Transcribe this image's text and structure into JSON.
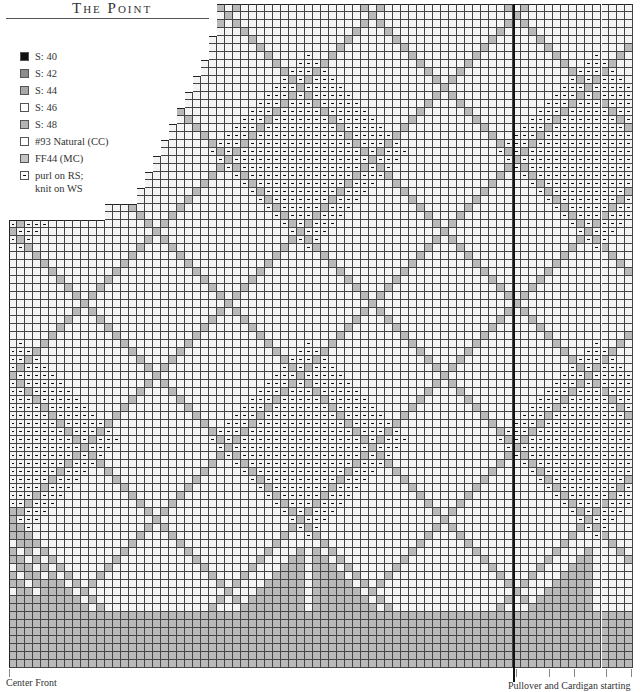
{
  "title": "The Point",
  "legend": [
    {
      "label": "S: 40",
      "color": "#111111",
      "purl": false
    },
    {
      "label": "S: 42",
      "color": "#8c8c8c",
      "purl": false
    },
    {
      "label": "S: 44",
      "color": "#a8a8a8",
      "purl": false
    },
    {
      "label": "S: 46",
      "color": "#ffffff",
      "purl": false
    },
    {
      "label": "S: 48",
      "color": "#b4b4b4",
      "purl": false
    },
    {
      "label": "#93 Natural (CC)",
      "color": "#ffffff",
      "purl": false
    },
    {
      "label": "FF44 (MC)",
      "color": "#c4c4c4",
      "purl": false
    },
    {
      "label": "purl on RS;\nknit on WS",
      "color": "#ffffff",
      "purl": true
    }
  ],
  "captions": {
    "center_front": "Center Front",
    "starting_points": "Pullover and Cardigan starting points."
  },
  "chart": {
    "origin_x": 9,
    "origin_y": 668,
    "cell": 8,
    "cols": 78,
    "rows": 83,
    "colors": {
      "cc": "#f4f4f4",
      "mc": "#b9b9b9",
      "line": "#444444"
    },
    "top_steps": [
      {
        "from_col": 0,
        "to_col": 12,
        "top_row": 56
      },
      {
        "from_col": 12,
        "to_col": 16,
        "top_row": 58
      },
      {
        "from_col": 16,
        "to_col": 17,
        "top_row": 60
      },
      {
        "from_col": 17,
        "to_col": 18,
        "top_row": 62
      },
      {
        "from_col": 18,
        "to_col": 19,
        "top_row": 64
      },
      {
        "from_col": 19,
        "to_col": 20,
        "top_row": 66
      },
      {
        "from_col": 20,
        "to_col": 21,
        "top_row": 68
      },
      {
        "from_col": 21,
        "to_col": 22,
        "top_row": 70
      },
      {
        "from_col": 22,
        "to_col": 23,
        "top_row": 72
      },
      {
        "from_col": 23,
        "to_col": 24,
        "top_row": 74
      },
      {
        "from_col": 24,
        "to_col": 25,
        "top_row": 76
      },
      {
        "from_col": 25,
        "to_col": 26,
        "top_row": 79
      },
      {
        "from_col": 26,
        "to_col": 78,
        "top_row": 83
      }
    ],
    "pattern": {
      "diamond_period": 18,
      "purl_period": 36,
      "purl_offset": 19,
      "base_rows": 7,
      "point_apexes": [
        {
          "col": 19,
          "row": 10,
          "type": "purl"
        },
        {
          "col": 36,
          "row": 4,
          "type": "cc"
        },
        {
          "col": 55,
          "row": 10,
          "type": "purl"
        },
        {
          "col": 70,
          "row": 8,
          "type": "cc"
        }
      ]
    },
    "thick_line_col": 63,
    "white_line_col": 74,
    "tick_x": [
      516,
      549,
      574,
      606,
      631
    ]
  }
}
